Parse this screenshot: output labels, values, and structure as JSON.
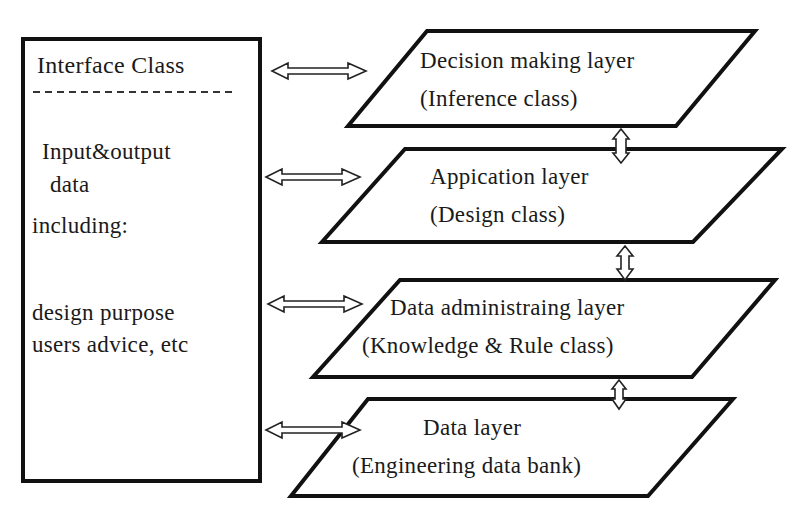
{
  "interface_box": {
    "title": "Interface Class",
    "lines": [
      "Input&output",
      "data",
      "including:",
      "design purpose",
      "users advice, etc"
    ]
  },
  "layers": [
    {
      "name": "Decision making layer",
      "subtitle": "(Inference class)"
    },
    {
      "name": "Appication layer",
      "subtitle": "(Design class)"
    },
    {
      "name": "Data administraing layer",
      "subtitle": "(Knowledge & Rule class)"
    },
    {
      "name": "Data layer",
      "subtitle": "(Engineering data bank)"
    }
  ],
  "connectors": {
    "horizontal": [
      "interface-decision",
      "interface-application",
      "interface-data-admin",
      "interface-data"
    ],
    "vertical": [
      "decision-application",
      "application-data-admin",
      "data-admin-data"
    ]
  },
  "colors": {
    "stroke": "#111111",
    "background": "#ffffff"
  }
}
